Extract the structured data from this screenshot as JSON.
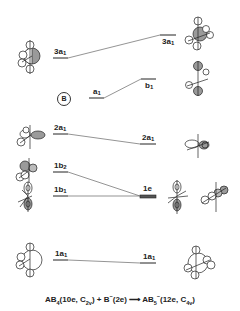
{
  "diagram": {
    "type": "correlation-diagram",
    "fragment_label": "B",
    "left_levels": [
      {
        "id": "3a1",
        "label": "3a",
        "sub": "1",
        "y": 58
      },
      {
        "id": "a1",
        "label": "a",
        "sub": "1",
        "y": 98
      },
      {
        "id": "2a1",
        "label": "2a",
        "sub": "1",
        "y": 134
      },
      {
        "id": "1b2",
        "label": "1b",
        "sub": "2",
        "y": 172
      },
      {
        "id": "1b1",
        "label": "1b",
        "sub": "1",
        "y": 196
      },
      {
        "id": "1a1",
        "label": "1a",
        "sub": "1",
        "y": 260
      }
    ],
    "right_levels": [
      {
        "id": "3a1",
        "label": "3a",
        "sub": "1",
        "y": 35
      },
      {
        "id": "b1",
        "label": "b",
        "sub": "1",
        "y": 79
      },
      {
        "id": "2a1",
        "label": "2a",
        "sub": "1",
        "y": 144
      },
      {
        "id": "1e",
        "label": "1e",
        "sub": "",
        "y": 196,
        "degenerate": true
      },
      {
        "id": "1a1",
        "label": "1a",
        "sub": "1",
        "y": 263
      }
    ],
    "correlations": [
      [
        "left.3a1",
        "right.3a1"
      ],
      [
        "left.a1",
        "right.b1"
      ],
      [
        "left.2a1",
        "right.2a1"
      ],
      [
        "left.1b2",
        "right.1e"
      ],
      [
        "left.1b1",
        "right.1e"
      ],
      [
        "left.1a1",
        "right.1a1"
      ]
    ],
    "equation": {
      "reactant1": "AB",
      "reactant1_sub": "4",
      "reactant1_info_a": "(10e, C",
      "reactant1_info_sub": "2v",
      "reactant1_info_b": ")",
      "plus": "+",
      "reactant2": "B",
      "reactant2_sup": "−",
      "reactant2_info": "(2e)",
      "arrow": "⟶",
      "product": "AB",
      "product_sub": "5",
      "product_sup": "−",
      "product_info_a": "(12e, C",
      "product_info_sub": "4v",
      "product_info_b": ")"
    },
    "colors": {
      "line": "#222222",
      "shaded_lobe": "#9a9a9a",
      "background": "#ffffff"
    }
  }
}
